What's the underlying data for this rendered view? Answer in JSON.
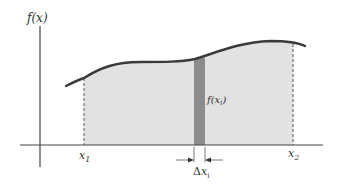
{
  "figure": {
    "type": "riemann-sum-area-under-curve",
    "labels": {
      "y_axis": "f(x)",
      "x_start": "x",
      "x_start_sub": "1",
      "x_end": "x",
      "x_end_sub": "2",
      "strip_height": "f(x",
      "strip_height_sub": "i",
      "strip_height_close": ")",
      "strip_width_delta": "Δ",
      "strip_width_var": "x",
      "strip_width_sub": "i"
    },
    "colors": {
      "axis": "#444444",
      "curve": "#3a3a3a",
      "area_fill": "#e2e2e2",
      "strip_fill": "#8c8c8c",
      "dashed_bounds": "#555555"
    }
  }
}
